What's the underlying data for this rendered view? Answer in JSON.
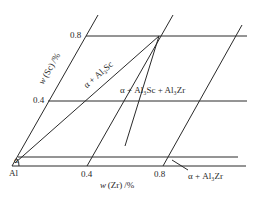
{
  "diagram": {
    "type": "isothermal-section-corner",
    "corner_label": "Al",
    "corner_phase": "α",
    "y_axis": {
      "label_var": "w",
      "label_element": "(Sc)",
      "label_unit": "/%",
      "ticks": [
        "0.4",
        "0.8"
      ]
    },
    "x_axis": {
      "label_var": "w",
      "label_element": "(Zr)",
      "label_unit": "/%",
      "ticks": [
        "0.4",
        "0.8"
      ]
    },
    "regions": [
      {
        "id": "alpha-al3sc",
        "label": "α + Al₃Sc"
      },
      {
        "id": "alpha-al3sc-al3zr",
        "label": "α + Al₃Sc + Al₃Zr"
      },
      {
        "id": "alpha-al3zr",
        "label": "α + Al₃Zr"
      }
    ],
    "colors": {
      "line": "#2a2a2a",
      "background": "#ffffff"
    }
  }
}
